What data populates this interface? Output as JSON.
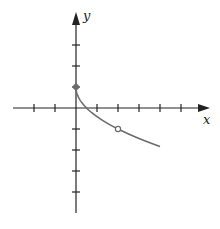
{
  "chart_data": {
    "type": "line",
    "title": "",
    "xlabel": "x",
    "ylabel": "y",
    "xlim": [
      -3,
      6
    ],
    "ylim": [
      -5,
      4
    ],
    "grid": false,
    "x_ticks": [
      -2,
      -1,
      1,
      2,
      3,
      4,
      5
    ],
    "y_ticks": [
      -4,
      -3,
      -2,
      -1,
      1,
      2,
      3
    ],
    "series": [
      {
        "name": "f(x)",
        "function": "y = 1 - sqrt(2x)",
        "x": [
          0,
          0.125,
          0.5,
          1,
          1.5,
          2,
          2.5,
          3,
          3.5,
          4
        ],
        "values": [
          1,
          0.5,
          0,
          -0.41,
          -0.73,
          -1,
          -1.24,
          -1.45,
          -1.65,
          -1.83
        ],
        "color": "#666666"
      }
    ],
    "annotations": [
      {
        "type": "closed-point",
        "x": 0,
        "y": 1
      },
      {
        "type": "open-point",
        "x": 2,
        "y": -1
      }
    ]
  },
  "colors": {
    "axis": "#222222",
    "curve": "#6b6b6b",
    "closed_point": "#6b6b6b",
    "open_point_fill": "#ffffff"
  },
  "labels": {
    "x_axis": "x",
    "y_axis": "y"
  }
}
